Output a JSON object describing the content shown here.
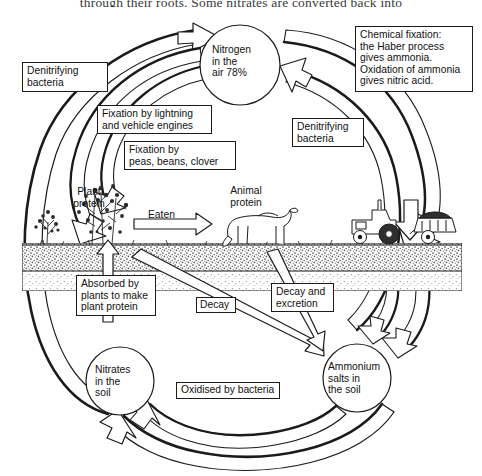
{
  "page": {
    "clipped_body_text": "through their roots. Some nitrates are converted back into",
    "figure_title": "The nitrogen cycle"
  },
  "nodes": [
    {
      "id": "nitrogen-air",
      "label": "Nitrogen\nin the\nair  78%",
      "shape": "circle",
      "cx": 240,
      "cy": 65,
      "r": 40
    },
    {
      "id": "nitrates-soil",
      "label": "Nitrates\nin the\nsoil",
      "shape": "circle",
      "cx": 120,
      "cy": 381,
      "r": 34
    },
    {
      "id": "ammonium-salts",
      "label": "Ammonium\nsalts in\nthe soil",
      "shape": "circle",
      "cx": 357,
      "cy": 378,
      "r": 34
    }
  ],
  "captions": [
    {
      "id": "plant-protein",
      "label": "Plant\nprotein",
      "x": 71,
      "y": 188
    },
    {
      "id": "animal-protein",
      "label": "Animal\nprotein",
      "x": 224,
      "y": 187
    }
  ],
  "labels": [
    {
      "id": "denitrifying-bacteria-left",
      "label": "Denitrifying\nbacteria",
      "x": 22,
      "y": 62,
      "w": 86,
      "h": 30
    },
    {
      "id": "fixation-lightning",
      "label": "Fixation by lightning\nand vehicle engines",
      "x": 97,
      "y": 105,
      "w": 115,
      "h": 29
    },
    {
      "id": "fixation-legumes",
      "label": "Fixation by\npeas, beans, clover",
      "x": 124,
      "y": 141,
      "w": 112,
      "h": 29
    },
    {
      "id": "chemical-fixation",
      "label": "Chemical fixation:\nthe Haber process\ngives ammonia.\nOxidation of ammonia\ngives nitric acid.",
      "x": 355,
      "y": 26,
      "w": 118,
      "h": 66
    },
    {
      "id": "denitrifying-bacteria-right",
      "label": "Denitrifying\nbacteria",
      "x": 292,
      "y": 118,
      "w": 72,
      "h": 29
    },
    {
      "id": "eaten",
      "label": "Eaten",
      "x": 148,
      "y": 211,
      "w": 38,
      "h": 15,
      "borderless": true
    },
    {
      "id": "absorbed-by-plants",
      "label": "Absorbed by\nplants to make\nplant protein",
      "x": 76,
      "y": 275,
      "w": 80,
      "h": 41
    },
    {
      "id": "decay",
      "label": "Decay",
      "x": 196,
      "y": 297,
      "w": 40,
      "h": 16
    },
    {
      "id": "decay-and-excretion",
      "label": "Decay and\nexcretion",
      "x": 271,
      "y": 283,
      "w": 63,
      "h": 29
    },
    {
      "id": "oxidised-by-bacteria",
      "label": "Oxidised by bacteria",
      "x": 176,
      "y": 382,
      "w": 104,
      "h": 17
    }
  ],
  "scene": {
    "ground_label": "soil-ground-band",
    "plants": "plant-illustration",
    "cow": "cow-illustration",
    "tractor": "tractor-illustration",
    "trailer": "fertiliser-trailer-illustration"
  },
  "colors": {
    "ink": "#1b1b1b",
    "paper": "#ffffff",
    "soil": "#6e6e6e",
    "arrow_fill": "#ffffff"
  },
  "flows": [
    {
      "id": "flow-nitrates-to-air",
      "from": "nitrates-soil",
      "to": "nitrogen-air",
      "via": "denitrifying-bacteria-left"
    },
    {
      "id": "flow-air-to-plant",
      "from": "nitrogen-air",
      "to": "plant-protein",
      "via": "fixation-lightning"
    },
    {
      "id": "flow-air-to-plant-legume",
      "from": "nitrogen-air",
      "to": "plant-protein",
      "via": "fixation-legumes"
    },
    {
      "id": "flow-ammonium-to-air",
      "from": "ammonium-salts",
      "to": "nitrogen-air",
      "via": "denitrifying-bacteria-right"
    },
    {
      "id": "flow-air-to-fertiliser",
      "from": "nitrogen-air",
      "to": "tractor",
      "via": "chemical-fixation"
    },
    {
      "id": "flow-fertiliser-to-ammonium",
      "from": "tractor",
      "to": "ammonium-salts",
      "via": ""
    },
    {
      "id": "flow-plant-eaten-animal",
      "from": "plant-protein",
      "to": "animal-protein",
      "via": "eaten"
    },
    {
      "id": "flow-nitrates-to-plant",
      "from": "nitrates-soil",
      "to": "plant-protein",
      "via": "absorbed-by-plants"
    },
    {
      "id": "flow-plant-to-ammonium",
      "from": "plant-protein",
      "to": "ammonium-salts",
      "via": "decay"
    },
    {
      "id": "flow-animal-to-ammonium",
      "from": "animal-protein",
      "to": "ammonium-salts",
      "via": "decay-and-excretion"
    },
    {
      "id": "flow-ammonium-to-nitrates",
      "from": "ammonium-salts",
      "to": "nitrates-soil",
      "via": "oxidised-by-bacteria"
    }
  ]
}
